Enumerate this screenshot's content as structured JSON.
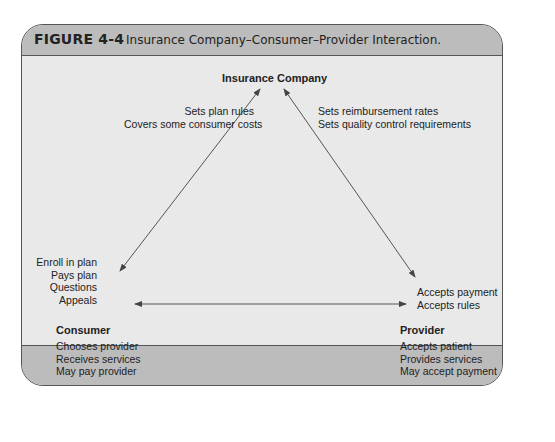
{
  "figure": {
    "label": "FIGURE 4-4",
    "caption": "Insurance Company–Consumer–Provider Interaction."
  },
  "nodes": {
    "insurance_company": {
      "title": "Insurance Company"
    },
    "consumer": {
      "title": "Consumer",
      "roles": [
        "Chooses provider",
        "Receives services",
        "May pay provider"
      ]
    },
    "provider": {
      "title": "Provider",
      "roles": [
        "Accepts patient",
        "Provides services",
        "May accept payment"
      ]
    }
  },
  "edges": {
    "insurance_to_consumer": [
      "Sets plan rules",
      "Covers some consumer costs"
    ],
    "insurance_to_provider": [
      "Sets reimbursement rates",
      "Sets quality control requirements"
    ],
    "consumer_to_insurance": [
      "Enroll in plan",
      "Pays plan",
      "Questions",
      "Appeals"
    ],
    "provider_to_insurance": [
      "Accepts payment",
      "Accepts rules"
    ]
  },
  "colors": {
    "header_bg": "#bcbcbc",
    "body_bg": "#e9e9e9",
    "border": "#555555",
    "text": "#222222"
  }
}
